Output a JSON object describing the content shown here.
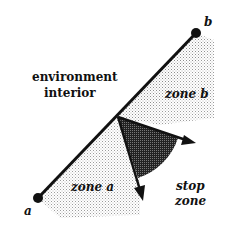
{
  "diagram": {
    "labels": {
      "environment_line1": "environment",
      "environment_line2": "interior",
      "zone_a": "zone a",
      "zone_b": "zone b",
      "stop_line1": "stop",
      "stop_line2": "zone",
      "point_a": "a",
      "point_b": "b"
    },
    "colors": {
      "line": "#111111",
      "light_stipple": "#c8c8c8",
      "dark_stipple": "#3a3a3a"
    }
  }
}
